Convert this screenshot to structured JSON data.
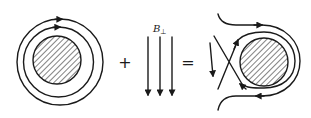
{
  "figure": {
    "left_panel": {
      "description": "Conductor cross-section with concentric circular magnetic field lines (clockwise)",
      "conductor_fill": "hatched",
      "rings": 2,
      "direction": "clockwise"
    },
    "operator_plus": "+",
    "middle_panel": {
      "description": "Uniform perpendicular field, three downward arrows",
      "label_main": "B",
      "label_sub": "⊥",
      "arrow_count": 3,
      "direction": "down"
    },
    "operator_equals": "=",
    "right_panel": {
      "description": "Superposition: field lines wrap around conductor with an X-point on the left",
      "conductor_fill": "hatched"
    },
    "colors": {
      "ink": "#1a1a1a",
      "background": "#ffffff"
    }
  }
}
